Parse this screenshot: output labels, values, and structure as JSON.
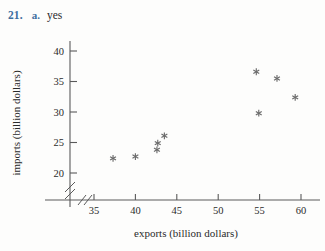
{
  "header": {
    "question_number": "21.",
    "part_label": "a.",
    "answer_text": "yes",
    "number_color": "#3f6f9f",
    "answer_color": "#2b2b2b"
  },
  "chart_data": {
    "type": "scatter",
    "title": "",
    "xlabel": "exports (billion dollars)",
    "ylabel": "imports (billion dollars)",
    "xlim": [
      33,
      61.5
    ],
    "ylim": [
      18.5,
      41
    ],
    "xticks": [
      35,
      40,
      45,
      50,
      55,
      60
    ],
    "xtick_labels": [
      "35",
      "40",
      "45",
      "50",
      "55",
      "60"
    ],
    "yticks": [
      20,
      25,
      30,
      35,
      40
    ],
    "ytick_labels": [
      "20",
      "25",
      "30",
      "35",
      "40"
    ],
    "grid": false,
    "legend": false,
    "axis_break_x": true,
    "axis_break_y": true,
    "marker": "asterisk",
    "marker_color": "#6b6b6b",
    "points": [
      {
        "x": 37.3,
        "y": 22.4
      },
      {
        "x": 40.0,
        "y": 22.7
      },
      {
        "x": 42.6,
        "y": 23.8
      },
      {
        "x": 42.7,
        "y": 24.9
      },
      {
        "x": 43.5,
        "y": 26.1
      },
      {
        "x": 54.6,
        "y": 36.6
      },
      {
        "x": 54.9,
        "y": 29.8
      },
      {
        "x": 57.1,
        "y": 35.5
      },
      {
        "x": 59.3,
        "y": 32.4
      }
    ]
  }
}
